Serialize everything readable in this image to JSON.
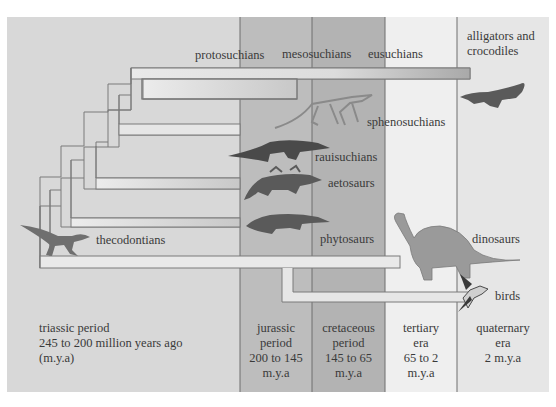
{
  "diagram": {
    "type": "phylogenetic-timeline",
    "colors": {
      "triassic": "#d8d8d8",
      "jurassic": "#bdbdbd",
      "cretaceous": "#b3b3b3",
      "tertiary": "#ededed",
      "quaternary": "#e6e6e6",
      "branch_fill": "#e9e9e9",
      "branch_stroke": "#7a7a7a",
      "divider": "#6e6e6e",
      "text": "#3a3a3a"
    },
    "periods": [
      {
        "id": "triassic",
        "lines": [
          "triassic period",
          "245 to 200 million years ago",
          "(m.y.a)"
        ]
      },
      {
        "id": "jurassic",
        "lines": [
          "jurassic",
          "period",
          "200 to 145",
          "m.y.a"
        ]
      },
      {
        "id": "cretaceous",
        "lines": [
          "cretaceous",
          "period",
          "145 to 65",
          "m.y.a"
        ]
      },
      {
        "id": "tertiary",
        "lines": [
          "tertiary",
          "era",
          "65 to 2",
          "m.y.a"
        ]
      },
      {
        "id": "quaternary",
        "lines": [
          "quaternary",
          "era",
          "2 m.y.a"
        ]
      }
    ],
    "groups": [
      {
        "id": "protosuchians",
        "label": "protosuchians"
      },
      {
        "id": "mesosuchians",
        "label": "mesosuchians"
      },
      {
        "id": "eusuchians",
        "label": "eusuchians"
      },
      {
        "id": "alligators",
        "label_lines": [
          "alligators and",
          "crocodiles"
        ]
      },
      {
        "id": "sphenosuchians",
        "label": "sphenosuchians"
      },
      {
        "id": "rauisuchians",
        "label": "rauisuchians"
      },
      {
        "id": "aetosaurs",
        "label": "aetosaurs"
      },
      {
        "id": "phytosaurs",
        "label": "phytosaurs"
      },
      {
        "id": "thecodontians",
        "label": "thecodontians"
      },
      {
        "id": "dinosaurs",
        "label": "dinosaurs"
      },
      {
        "id": "birds",
        "label": "birds"
      }
    ],
    "icons": [
      "thecodont-lizard-icon",
      "sphenosuchian-icon",
      "rauisuchian-icon",
      "aetosaur-icon",
      "phytosaur-icon",
      "sauropod-dinosaur-icon",
      "bird-icon",
      "crocodile-icon"
    ]
  }
}
